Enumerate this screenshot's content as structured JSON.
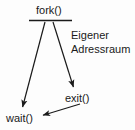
{
  "diagram": {
    "type": "process-fork-flow",
    "language": "de",
    "background_color": "#fdfdfd",
    "stroke_color": "#1a1a1a",
    "text_color": "#1a1a1a",
    "nodes": {
      "fork": {
        "label": "fork()",
        "x": 52,
        "y": 11
      },
      "exit": {
        "label": "exit()",
        "x": 81,
        "y": 99
      },
      "wait": {
        "label": "wait()",
        "x": 23,
        "y": 119
      }
    },
    "separator": {
      "name": "fork-divider-line",
      "x1": 29,
      "y1": 20,
      "x2": 72,
      "y2": 20
    },
    "arrows": [
      {
        "name": "fork-to-wait",
        "from": "fork",
        "to": "wait",
        "x1": 45,
        "y1": 22,
        "x2": 22,
        "y2": 110
      },
      {
        "name": "fork-to-exit",
        "from": "fork",
        "to": "exit",
        "x1": 53,
        "y1": 22,
        "x2": 74,
        "y2": 90
      },
      {
        "name": "exit-to-wait",
        "from": "exit",
        "to": "wait",
        "x1": 80,
        "y1": 104,
        "x2": 40,
        "y2": 116
      }
    ],
    "annotation": {
      "name": "address-space-annotation",
      "line_1": "Eigener",
      "line_2": "Adressraum"
    }
  }
}
